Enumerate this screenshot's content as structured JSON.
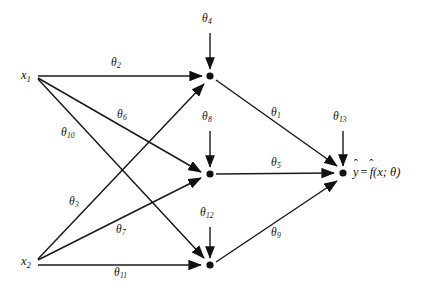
{
  "figure": {
    "type": "neural-network-computational-graph",
    "background_color": "#ffffff",
    "ink_color": "#111111"
  },
  "nodes": {
    "inputs": [
      {
        "id": "x1",
        "label": "x",
        "sub": "1",
        "x": 38,
        "y": 76,
        "label_x": 21,
        "label_y": 69
      },
      {
        "id": "x2",
        "label": "x",
        "sub": "2",
        "x": 38,
        "y": 262,
        "label_x": 21,
        "label_y": 255
      }
    ],
    "hidden": [
      {
        "id": "h1",
        "x": 210,
        "y": 76
      },
      {
        "id": "h2",
        "x": 210,
        "y": 174
      },
      {
        "id": "h3",
        "x": 210,
        "y": 265
      }
    ],
    "output": {
      "id": "yhat",
      "x": 343,
      "y": 173,
      "text_parts": {
        "yhat": "y",
        "equals": "=",
        "fhat": "f",
        "args": "(x; θ)"
      },
      "label_x": 353,
      "label_y": 166
    }
  },
  "edges": [
    {
      "id": "e-x1-h1",
      "from": "x1",
      "to": "h1",
      "weight": "θ",
      "sub": "2",
      "label_x": 111,
      "label_y": 57
    },
    {
      "id": "e-x1-h2",
      "from": "x1",
      "to": "h2",
      "weight": "θ",
      "sub": "6",
      "label_x": 117,
      "label_y": 109
    },
    {
      "id": "e-x1-h3",
      "from": "x1",
      "to": "h3",
      "weight": "θ",
      "sub": "10",
      "label_x": 61,
      "label_y": 127
    },
    {
      "id": "e-x2-h1",
      "from": "x2",
      "to": "h1",
      "weight": "θ",
      "sub": "3",
      "label_x": 69,
      "label_y": 196
    },
    {
      "id": "e-x2-h2",
      "from": "x2",
      "to": "h2",
      "weight": "θ",
      "sub": "7",
      "label_x": 116,
      "label_y": 224
    },
    {
      "id": "e-x2-h3",
      "from": "x2",
      "to": "h3",
      "weight": "θ",
      "sub": "11",
      "label_x": 114,
      "label_y": 267
    },
    {
      "id": "e-h1-out",
      "from": "h1",
      "to": "yhat",
      "weight": "θ",
      "sub": "1",
      "label_x": 271,
      "label_y": 107
    },
    {
      "id": "e-h2-out",
      "from": "h2",
      "to": "yhat",
      "weight": "θ",
      "sub": "5",
      "label_x": 271,
      "label_y": 157
    },
    {
      "id": "e-h3-out",
      "from": "h3",
      "to": "yhat",
      "weight": "θ",
      "sub": "9",
      "label_x": 271,
      "label_y": 227
    }
  ],
  "biases": [
    {
      "id": "b-h1",
      "target": "h1",
      "weight": "θ",
      "sub": "4",
      "label_x": 202,
      "label_y": 13,
      "line_x": 210,
      "line_y1": 33,
      "line_y2": 69
    },
    {
      "id": "b-h2",
      "target": "h2",
      "weight": "θ",
      "sub": "8",
      "label_x": 202,
      "label_y": 111,
      "line_x": 210,
      "line_y1": 131,
      "line_y2": 167
    },
    {
      "id": "b-h3",
      "target": "h3",
      "weight": "θ",
      "sub": "12",
      "label_x": 200,
      "label_y": 207,
      "line_x": 210,
      "line_y1": 227,
      "line_y2": 258
    },
    {
      "id": "b-out",
      "target": "yhat",
      "weight": "θ",
      "sub": "13",
      "label_x": 333,
      "label_y": 111,
      "line_x": 343,
      "line_y1": 131,
      "line_y2": 166
    }
  ]
}
